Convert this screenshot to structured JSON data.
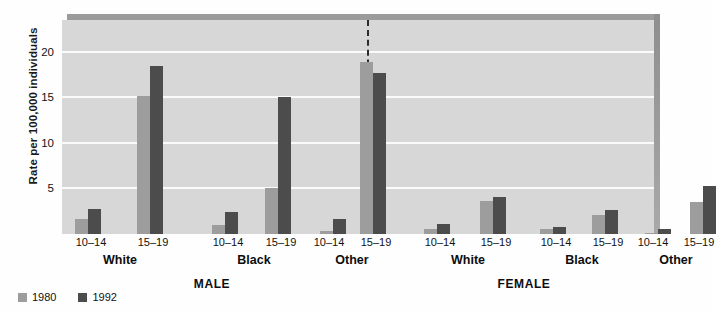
{
  "chart_data": {
    "type": "bar",
    "title": "",
    "xlabel": "",
    "ylabel": "Rate per 100,000 individuals",
    "ylim": [
      0,
      23.5
    ],
    "yticks": [
      5,
      10,
      15,
      20
    ],
    "grid": true,
    "legend_position": "bottom-left",
    "panels": [
      "MALE",
      "FEMALE"
    ],
    "races": [
      "White",
      "Black",
      "Other"
    ],
    "age_groups": [
      "10–14",
      "15–19"
    ],
    "series": [
      {
        "name": "1980",
        "color": "#9d9d9d"
      },
      {
        "name": "1992",
        "color": "#4c4c4c"
      }
    ],
    "categories": [
      "MALE White 10–14",
      "MALE White 15–19",
      "MALE Black 10–14",
      "MALE Black 15–19",
      "MALE Other 10–14",
      "MALE Other 15–19",
      "FEMALE White 10–14",
      "FEMALE White 15–19",
      "FEMALE Black 10–14",
      "FEMALE Black 15–19",
      "FEMALE Other 10–14",
      "FEMALE Other 15–19"
    ],
    "values": {
      "1980": [
        1.7,
        15.2,
        1.0,
        5.1,
        0.3,
        18.9,
        0.5,
        3.6,
        0.5,
        2.1,
        0.1,
        3.5
      ],
      "1992": [
        2.8,
        18.5,
        2.4,
        15.0,
        1.7,
        17.7,
        1.1,
        4.1,
        0.8,
        2.6,
        0.6,
        5.3
      ]
    },
    "bars": [
      {
        "panel": "MALE",
        "race": "White",
        "age": "10–14",
        "x": 75,
        "y1980": 1.7,
        "y1992": 2.8
      },
      {
        "panel": "MALE",
        "race": "White",
        "age": "15–19",
        "x": 137,
        "y1980": 15.2,
        "y1992": 18.5
      },
      {
        "panel": "MALE",
        "race": "Black",
        "age": "10–14",
        "x": 212,
        "y1980": 1.0,
        "y1992": 2.4
      },
      {
        "panel": "MALE",
        "race": "Black",
        "age": "15–19",
        "x": 265,
        "y1980": 5.1,
        "y1992": 15.0
      },
      {
        "panel": "MALE",
        "race": "Other",
        "age": "10–14",
        "x": 320,
        "y1980": 0.3,
        "y1992": 1.7
      },
      {
        "panel": "MALE",
        "race": "Other",
        "age": "15–19",
        "x": 360,
        "y1980": 18.9,
        "y1992": 17.7
      },
      {
        "panel": "FEMALE",
        "race": "White",
        "age": "10–14",
        "x": 424,
        "y1980": 0.5,
        "y1992": 1.1
      },
      {
        "panel": "FEMALE",
        "race": "White",
        "age": "15–19",
        "x": 480,
        "y1980": 3.6,
        "y1992": 4.1
      },
      {
        "panel": "FEMALE",
        "race": "Black",
        "age": "10–14",
        "x": 540,
        "y1980": 0.5,
        "y1992": 0.8
      },
      {
        "panel": "FEMALE",
        "race": "Black",
        "age": "15–19",
        "x": 592,
        "y1980": 2.1,
        "y1992": 2.6
      },
      {
        "panel": "FEMALE",
        "race": "Other",
        "age": "10–14",
        "x": 645,
        "y1980": 0.1,
        "y1992": 0.6
      },
      {
        "panel": "FEMALE",
        "race": "Other",
        "age": "15–19",
        "x": 690,
        "y1980": 3.5,
        "y1992": 5.3
      }
    ],
    "tick_labels": [
      {
        "text": "10–14",
        "x": 91
      },
      {
        "text": "15–19",
        "x": 153
      },
      {
        "text": "10–14",
        "x": 228
      },
      {
        "text": "15–19",
        "x": 281
      },
      {
        "text": "10–14",
        "x": 329
      },
      {
        "text": "15–19",
        "x": 376
      },
      {
        "text": "10–14",
        "x": 440
      },
      {
        "text": "15–19",
        "x": 496
      },
      {
        "text": "10–14",
        "x": 556
      },
      {
        "text": "15–19",
        "x": 608
      },
      {
        "text": "10–14",
        "x": 653
      },
      {
        "text": "15–19",
        "x": 699
      }
    ],
    "group_labels": [
      {
        "text": "White",
        "x": 120
      },
      {
        "text": "Black",
        "x": 254
      },
      {
        "text": "Other",
        "x": 352
      },
      {
        "text": "White",
        "x": 468
      },
      {
        "text": "Black",
        "x": 582
      },
      {
        "text": "Other",
        "x": 676
      }
    ],
    "panel_labels": [
      {
        "text": "MALE",
        "x": 212
      },
      {
        "text": "FEMALE",
        "x": 524
      }
    ],
    "divider_x_ratio": 0.515,
    "colors": {
      "plot_background": "#d7d7d7",
      "gridline": "#fbfbfb",
      "series_1980": "#9d9d9d",
      "series_1992": "#4c4c4c",
      "divider": "#2b2b2b",
      "text": "#111111"
    }
  },
  "legend": {
    "items": [
      {
        "label": "1980",
        "swatch": "y1980"
      },
      {
        "label": "1992",
        "swatch": "y1992"
      }
    ]
  }
}
